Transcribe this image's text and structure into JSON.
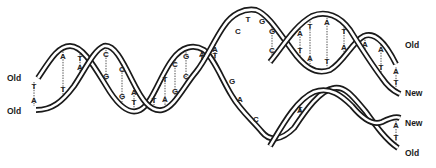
{
  "figure": {
    "labels": {
      "left_top": "Old",
      "left_bottom": "Old",
      "right_1": "Old",
      "right_2": "New",
      "right_3": "New",
      "right_4": "Old"
    },
    "parent_helix_pairs": [
      {
        "x": 34,
        "top": "T",
        "bottom": "A"
      },
      {
        "x": 63,
        "top": "A",
        "bottom": "T"
      },
      {
        "x": 80,
        "top": "T",
        "bottom": "A"
      },
      {
        "x": 93,
        "top": "G",
        "bottom": ""
      },
      {
        "x": 106,
        "top": "C",
        "bottom": "G"
      },
      {
        "x": 122,
        "top": "C",
        "bottom": "G"
      },
      {
        "x": 134,
        "top": "A",
        "bottom": "T"
      },
      {
        "x": 141,
        "top": "G",
        "bottom": "C"
      },
      {
        "x": 154,
        "top": "T",
        "bottom": ""
      },
      {
        "x": 165,
        "top": "T",
        "bottom": "A"
      },
      {
        "x": 175,
        "top": "C",
        "bottom": "G"
      },
      {
        "x": 186,
        "top": "G",
        "bottom": "C"
      },
      {
        "x": 202,
        "top": "T",
        "bottom": "A"
      },
      {
        "x": 215,
        "top": "A",
        "bottom": "T"
      }
    ],
    "fork_unpaired_top": [
      "C",
      "T",
      "G"
    ],
    "fork_unpaired_bottom": [
      "G",
      "A",
      "C"
    ],
    "daughter_upper_pairs": [
      {
        "x": 272,
        "top": "G",
        "bottom": "C"
      },
      {
        "x": 285,
        "top": "G",
        "bottom": "C"
      },
      {
        "x": 300,
        "top": "A",
        "bottom": "T"
      },
      {
        "x": 310,
        "top": "T",
        "bottom": "A"
      },
      {
        "x": 327,
        "top": "A",
        "bottom": "T"
      },
      {
        "x": 344,
        "top": "T",
        "bottom": "A"
      },
      {
        "x": 357,
        "top": "G",
        "bottom": "C"
      },
      {
        "x": 365,
        "top": "A",
        "bottom": ""
      },
      {
        "x": 381,
        "top": "A",
        "bottom": "T"
      },
      {
        "x": 396,
        "top": "A",
        "bottom": "T"
      }
    ],
    "daughter_lower_pairs": [
      {
        "x": 270,
        "top": "G",
        "bottom": "C"
      },
      {
        "x": 283,
        "top": "G",
        "bottom": "C"
      },
      {
        "x": 300,
        "top": "A",
        "bottom": "T"
      },
      {
        "x": 310,
        "top": "T",
        "bottom": "A"
      },
      {
        "x": 327,
        "top": "A",
        "bottom": "T"
      },
      {
        "x": 344,
        "top": "T",
        "bottom": "A"
      },
      {
        "x": 352,
        "top": "G",
        "bottom": ""
      },
      {
        "x": 365,
        "top": "A",
        "bottom": ""
      },
      {
        "x": 381,
        "top": "A",
        "bottom": "T"
      },
      {
        "x": 396,
        "top": "A",
        "bottom": "T"
      }
    ]
  }
}
